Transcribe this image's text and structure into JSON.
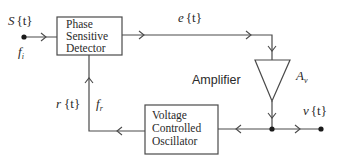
{
  "diagram": {
    "type": "block-diagram",
    "blocks": {
      "psd": {
        "lines": [
          "Phase",
          "Sensitive",
          "Detector"
        ]
      },
      "vco": {
        "lines": [
          "Voltage",
          "Controlled",
          "Oscillator"
        ]
      },
      "amplifier": {
        "label": "Amplifier",
        "gain": "A",
        "gain_sub": "v"
      }
    },
    "signals": {
      "input": {
        "name": "S",
        "arg": "{t}",
        "freq": "f",
        "freq_sub": "i"
      },
      "error": {
        "name": "e",
        "arg": "{t}"
      },
      "reference": {
        "name": "r",
        "arg": "{t}",
        "freq": "f",
        "freq_sub": "r"
      },
      "output": {
        "name": "v",
        "arg": "{t}"
      }
    },
    "colors": {
      "line": "#4a4a4a",
      "text": "#2a2a2a",
      "dot": "#1a1a1a",
      "background": "#ffffff"
    }
  }
}
